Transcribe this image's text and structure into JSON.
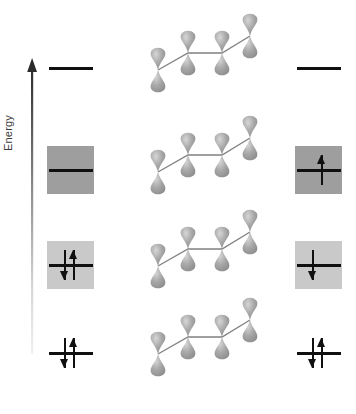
{
  "figure": {
    "type": "molecular-orbital-energy-diagram",
    "molecule": "1,3-butadiene",
    "axis_label": "Energy",
    "background_color": "#ffffff",
    "line_color": "#101010",
    "orbital_lobe_color": "#a8a8a8",
    "orbital_bond_color": "#808080",
    "axis_arrow_color_top": "#2b2b2b",
    "axis_arrow_color_bottom": "#e8e8e8"
  },
  "energy_levels": [
    {
      "index": 0,
      "name": "pi-4-antibonding",
      "y": 68,
      "left": {
        "box": false,
        "box_color": null,
        "electrons": []
      },
      "right": {
        "box": false,
        "box_color": null,
        "electrons": []
      }
    },
    {
      "index": 1,
      "name": "pi-3-antibonding",
      "y": 170,
      "left": {
        "box": true,
        "box_color": "#9e9e9e",
        "electrons": []
      },
      "right": {
        "box": true,
        "box_color": "#9e9e9e",
        "electrons": [
          "up"
        ]
      }
    },
    {
      "index": 2,
      "name": "pi-2-bonding",
      "y": 265,
      "left": {
        "box": true,
        "box_color": "#c9c9c9",
        "electrons": [
          "up",
          "down"
        ]
      },
      "right": {
        "box": true,
        "box_color": "#c9c9c9",
        "electrons": [
          "down"
        ]
      }
    },
    {
      "index": 3,
      "name": "pi-1-bonding",
      "y": 353,
      "left": {
        "box": false,
        "box_color": null,
        "electrons": [
          "up",
          "down"
        ]
      },
      "right": {
        "box": false,
        "box_color": null,
        "electrons": [
          "up",
          "down"
        ]
      }
    }
  ],
  "orbital_rows": [
    {
      "index": 0,
      "name": "orbital-diagram-level-4",
      "y": 26
    },
    {
      "index": 1,
      "name": "orbital-diagram-level-3",
      "y": 128
    },
    {
      "index": 2,
      "name": "orbital-diagram-level-2",
      "y": 222
    },
    {
      "index": 3,
      "name": "orbital-diagram-level-1",
      "y": 310
    }
  ],
  "orbital_geometry": {
    "p_orbital_count": 4,
    "lobes_per_orbital": 2,
    "centers": [
      {
        "cx": 26,
        "cy": 62
      },
      {
        "cx": 56,
        "cy": 45
      },
      {
        "cx": 90,
        "cy": 45
      },
      {
        "cx": 118,
        "cy": 28
      }
    ],
    "bond_path": "zigzag carbon skeleton connecting the four p-orbital centers"
  }
}
